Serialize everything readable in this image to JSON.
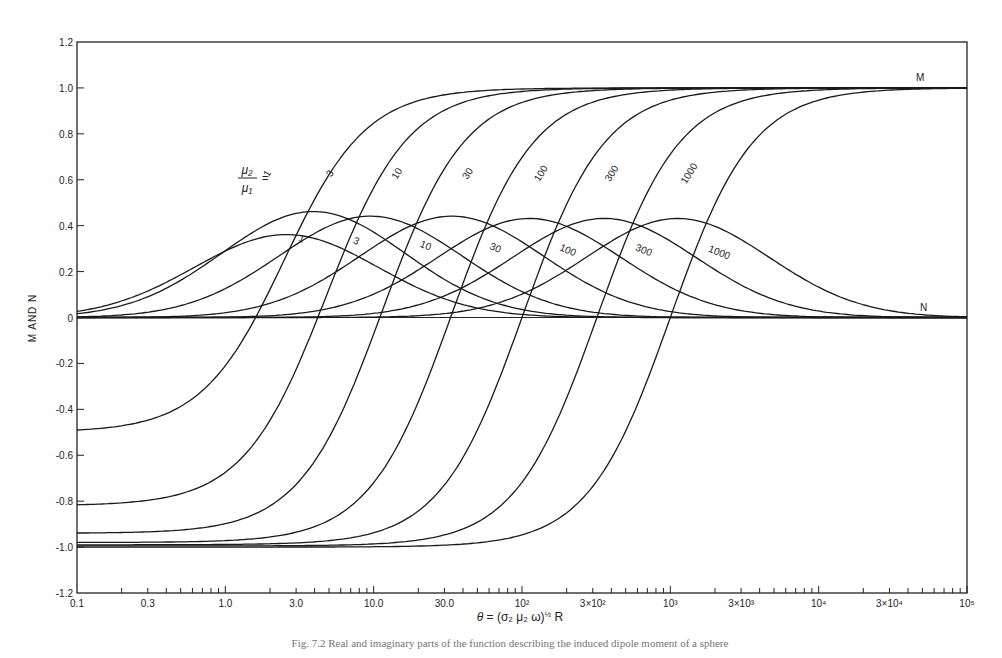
{
  "chart_data": {
    "type": "line",
    "title": "",
    "xlabel": "θ = (σ₂ μ₂ ω)^½ R",
    "ylabel": "M AND N",
    "xscale": "log",
    "xlim": [
      0.1,
      100000
    ],
    "ylim": [
      -1.2,
      1.2
    ],
    "grid": false,
    "legend_position": "inline labels on curves",
    "x_tick_labels": [
      "0.1",
      "0.3",
      "1.0",
      "3.0",
      "10.0",
      "30.0",
      "10²",
      "3×10²",
      "10³",
      "3×10³",
      "10⁴",
      "3×10⁴",
      "10⁵"
    ],
    "x_tick_values": [
      0.1,
      0.3,
      1,
      3,
      10,
      30,
      100,
      300,
      1000,
      3000,
      10000,
      30000,
      100000
    ],
    "y_tick_labels": [
      "1.2",
      "1.0",
      "0.8",
      "0.6",
      "0.4",
      "0.2",
      "0",
      "-0.2",
      "-0.4",
      "-0.6",
      "-0.8",
      "-1.0",
      "-1.2"
    ],
    "y_tick_values": [
      1.2,
      1.0,
      0.8,
      0.6,
      0.4,
      0.2,
      0,
      -0.2,
      -0.4,
      -0.6,
      -0.8,
      -1.0,
      -1.2
    ],
    "parameter_label": "μ₂/μ₁ =",
    "annotations": [
      {
        "text": "M",
        "x": 70000,
        "y": 1.04
      },
      {
        "text": "N",
        "x": 35000,
        "y": 0.04
      }
    ],
    "series": [
      {
        "name": "M, μ2/μ1=1",
        "family": "M",
        "ratio": "1",
        "start": -0.5,
        "end": 1.0,
        "theta_zero_cross": 1.6,
        "theta_mid_rise": 2.5
      },
      {
        "name": "M, μ2/μ1=3",
        "family": "M",
        "ratio": "3",
        "start": -0.82,
        "end": 1.0,
        "theta_zero_cross": 4.2,
        "theta_mid_rise": 6
      },
      {
        "name": "M, μ2/μ1=10",
        "family": "M",
        "ratio": "10",
        "start": -0.94,
        "end": 1.0,
        "theta_zero_cross": 11,
        "theta_mid_rise": 17
      },
      {
        "name": "M, μ2/μ1=30",
        "family": "M",
        "ratio": "30",
        "start": -0.98,
        "end": 1.0,
        "theta_zero_cross": 33,
        "theta_mid_rise": 50
      },
      {
        "name": "M, μ2/μ1=100",
        "family": "M",
        "ratio": "100",
        "start": -0.99,
        "end": 1.0,
        "theta_zero_cross": 100,
        "theta_mid_rise": 150
      },
      {
        "name": "M, μ2/μ1=300",
        "family": "M",
        "ratio": "300",
        "start": -0.995,
        "end": 1.0,
        "theta_zero_cross": 320,
        "theta_mid_rise": 480
      },
      {
        "name": "M, μ2/μ1=1000",
        "family": "M",
        "ratio": "1000",
        "start": -1.0,
        "end": 1.0,
        "theta_zero_cross": 1000,
        "theta_mid_rise": 1500
      },
      {
        "name": "N, μ2/μ1=1",
        "family": "N",
        "ratio": "1",
        "peak_theta": 2.3,
        "peak_value": 0.36
      },
      {
        "name": "N, μ2/μ1=3",
        "family": "N",
        "ratio": "3",
        "peak_theta": 3.5,
        "peak_value": 0.46
      },
      {
        "name": "N, μ2/μ1=10",
        "family": "N",
        "ratio": "10",
        "peak_theta": 8.5,
        "peak_value": 0.44
      },
      {
        "name": "N, μ2/μ1=30",
        "family": "N",
        "ratio": "30",
        "peak_theta": 30,
        "peak_value": 0.44
      },
      {
        "name": "N, μ2/μ1=100",
        "family": "N",
        "ratio": "100",
        "peak_theta": 100,
        "peak_value": 0.43
      },
      {
        "name": "N, μ2/μ1=300",
        "family": "N",
        "ratio": "300",
        "peak_theta": 320,
        "peak_value": 0.43
      },
      {
        "name": "N, μ2/μ1=1000",
        "family": "N",
        "ratio": "1000",
        "peak_theta": 1000,
        "peak_value": 0.43
      }
    ],
    "m_curve_labels": [
      {
        "text": "1",
        "x": 2.0,
        "y": 0.62
      },
      {
        "text": "3",
        "x": 5.3,
        "y": 0.62
      },
      {
        "text": "10",
        "x": 15,
        "y": 0.62
      },
      {
        "text": "30",
        "x": 45,
        "y": 0.62
      },
      {
        "text": "100",
        "x": 140,
        "y": 0.62
      },
      {
        "text": "300",
        "x": 420,
        "y": 0.62
      },
      {
        "text": "1000",
        "x": 1400,
        "y": 0.62
      }
    ],
    "n_curve_labels": [
      {
        "text": "1",
        "x": 3.2,
        "y": 0.33
      },
      {
        "text": "3",
        "x": 7.5,
        "y": 0.32
      },
      {
        "text": "10",
        "x": 22,
        "y": 0.3
      },
      {
        "text": "30",
        "x": 65,
        "y": 0.29
      },
      {
        "text": "100",
        "x": 200,
        "y": 0.28
      },
      {
        "text": "300",
        "x": 650,
        "y": 0.28
      },
      {
        "text": "1000",
        "x": 2100,
        "y": 0.27
      }
    ]
  },
  "figure": {
    "ylabel": "M AND N",
    "xlabel_theta": "θ",
    "xlabel_rest": " = (σ₂ μ₂ ω)",
    "xlabel_exp": "½",
    "xlabel_tail": " R",
    "param_num": "μ₂",
    "param_den": "μ₁",
    "param_eq": "=",
    "m_label": "M",
    "n_label": "N",
    "caption": "Fig. 7.2  Real and imaginary parts of the function describing the induced dipole moment of a sphere"
  }
}
